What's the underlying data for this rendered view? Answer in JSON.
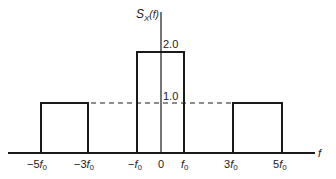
{
  "figure": {
    "y_axis_label": "S",
    "y_axis_label_sub": "X",
    "y_axis_label_arg": "(f)",
    "x_axis_label": "f",
    "level_labels": {
      "high": "2.0",
      "low": "1.0"
    },
    "x_ticks": [
      {
        "coef": "−5",
        "sym": "f",
        "sub": "0"
      },
      {
        "coef": "−3",
        "sym": "f",
        "sub": "0"
      },
      {
        "coef": "−",
        "sym": "f",
        "sub": "0"
      },
      {
        "coef": "0",
        "sym": "",
        "sub": ""
      },
      {
        "coef": "",
        "sym": "f",
        "sub": "0"
      },
      {
        "coef": "3",
        "sym": "f",
        "sub": "0"
      },
      {
        "coef": "5",
        "sym": "f",
        "sub": "0"
      }
    ],
    "segments": [
      {
        "from": "-5f0",
        "to": "-3f0",
        "height": 1.0
      },
      {
        "from": "-f0",
        "to": "f0",
        "height": 2.0
      },
      {
        "from": "3f0",
        "to": "5f0",
        "height": 1.0
      }
    ],
    "dashed_reference_level": 1.0,
    "line_color": "#1a1a1a"
  }
}
